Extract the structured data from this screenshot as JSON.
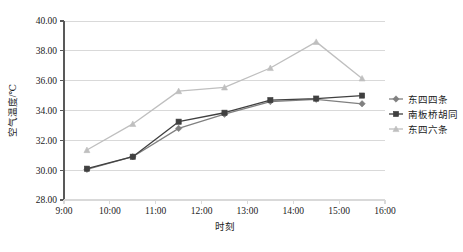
{
  "chart_data": {
    "type": "line",
    "title": "",
    "xlabel": "时刻",
    "ylabel": "空气温度/℃",
    "x": [
      "9:30",
      "10:30",
      "11:30",
      "12:30",
      "13:30",
      "14:30",
      "15:30"
    ],
    "xticklabels": [
      "9:00",
      "10:00",
      "11:00",
      "12:00",
      "13:00",
      "14:00",
      "15:00",
      "16:00"
    ],
    "yticklabels": [
      "28.00",
      "30.00",
      "32.00",
      "34.00",
      "36.00",
      "38.00",
      "40.00"
    ],
    "xlim": [
      9,
      16
    ],
    "ylim": [
      28,
      40
    ],
    "grid": true,
    "legend_position": "right",
    "series": [
      {
        "name": "东四四条",
        "color": "#808080",
        "marker": "diamond",
        "values": [
          30.05,
          30.9,
          32.8,
          33.75,
          34.6,
          34.75,
          34.45
        ]
      },
      {
        "name": "南板桥胡同",
        "color": "#404040",
        "marker": "square",
        "values": [
          30.1,
          30.9,
          33.25,
          33.85,
          34.7,
          34.8,
          35.0
        ]
      },
      {
        "name": "东四六条",
        "color": "#bfbfbf",
        "marker": "triangle",
        "values": [
          31.35,
          33.1,
          35.3,
          35.55,
          36.85,
          38.6,
          36.15
        ]
      }
    ]
  },
  "axis": {
    "y_label": "空气温度/℃",
    "x_label": "时刻"
  },
  "colors": {
    "axis_line": "#595959",
    "grid_line": "#d9d9d9",
    "text": "#1a1a1a",
    "series_1": "#808080",
    "series_2": "#404040",
    "series_3": "#bfbfbf"
  }
}
